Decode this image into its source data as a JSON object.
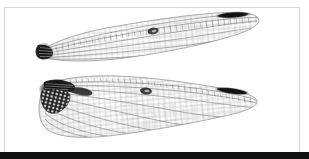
{
  "figure": {
    "kind": "specimen-photograph",
    "caption": "",
    "background_color": "#ffffff",
    "frame": {
      "present": true,
      "border_color": "#d8d8d8",
      "x": 4,
      "y": 7,
      "width": 296,
      "height": 146
    },
    "bottom_band": {
      "present": true,
      "color": "#111111",
      "x": 0,
      "y": 152,
      "width": 309,
      "height": 7
    }
  },
  "specimens": [
    {
      "id": "forewing",
      "label": "forewing",
      "orientation": "base-left-tip-right",
      "membrane_color": "#fbfbfb",
      "vein_color": "#7d7d7d",
      "outline_color": "#8c8c8c",
      "base": {
        "label": "wing-base",
        "color": "#1b1b1b",
        "x": 36,
        "y": 44,
        "width": 16,
        "height": 16
      },
      "nodus": {
        "label": "nodus-spot",
        "color": "#2a2a2a",
        "x": 148,
        "y": 28,
        "width": 10,
        "height": 7
      },
      "pterostigma": {
        "label": "pterostigma",
        "color": "#1a1a1a",
        "x": 216,
        "y": 11,
        "width": 34,
        "height": 7
      },
      "span_px": 230,
      "chord_px": 38
    },
    {
      "id": "hindwing",
      "label": "hindwing",
      "orientation": "base-left-tip-right",
      "membrane_color": "#fbfbfb",
      "vein_color": "#7d7d7d",
      "outline_color": "#8c8c8c",
      "base": {
        "label": "wing-base",
        "color": "#141414",
        "x": 40,
        "y": 76,
        "width": 28,
        "height": 18
      },
      "anal_triangle": {
        "label": "anal-triangle",
        "color": "#242424",
        "x": 44,
        "y": 88,
        "width": 24,
        "height": 24
      },
      "nodus": {
        "label": "nodus-spot",
        "color": "#2a2a2a",
        "x": 140,
        "y": 88,
        "width": 11,
        "height": 7
      },
      "pterostigma": {
        "label": "pterostigma",
        "color": "#1a1a1a",
        "x": 215,
        "y": 87,
        "width": 35,
        "height": 7
      },
      "span_px": 245,
      "chord_px": 62
    }
  ],
  "palette": {
    "paper_white": "#ffffff",
    "frame_gray": "#d8d8d8",
    "vein_gray": "#7d7d7d",
    "dark_ink": "#111111"
  }
}
